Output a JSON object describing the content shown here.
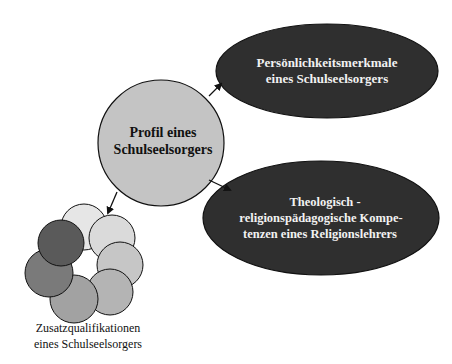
{
  "diagram": {
    "central_node": {
      "line1": "Profil eines",
      "line2": "Schulseelsorgers",
      "fill": "#c4c4c4"
    },
    "top_node": {
      "line1": "Persönlichkeitsmerkmale",
      "line2": "eines Schulseelsorgers",
      "fill": "#2f2f2f"
    },
    "bottom_node": {
      "line1": "Theologisch -",
      "line2": "religionspädagogische Kompe-",
      "line3": "tenzen eines Religionslehrers",
      "fill": "#2f2f2f"
    },
    "cluster_node": {
      "label_line1": "Zusatzqualifikationen",
      "label_line2": "eines Schulseelsorgers",
      "circle_fills": [
        "#e6e6e6",
        "#dadada",
        "#c6c6c6",
        "#b4b4b4",
        "#a2a2a2",
        "#7a7a7a",
        "#5a5a5a"
      ]
    },
    "arrow_color": "#111111",
    "text_light": "#f2f2f2",
    "text_dark": "#111111"
  }
}
